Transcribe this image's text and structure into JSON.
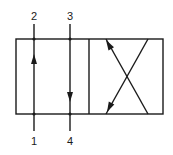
{
  "diagram": {
    "type": "hydraulic-directional-valve-symbol",
    "colors": {
      "stroke": "#1a1a1a",
      "background": "#ffffff"
    },
    "ports": {
      "top_left": "2",
      "top_right": "3",
      "bottom_left": "1",
      "bottom_right": "4"
    },
    "positions": [
      {
        "name": "straight-through",
        "flows": [
          "1 to 2 (up)",
          "3 to 4 (down)"
        ]
      },
      {
        "name": "crossed",
        "flows": [
          "crossed paths"
        ]
      }
    ]
  }
}
